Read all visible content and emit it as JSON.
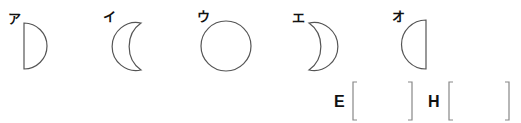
{
  "figures": [
    {
      "label": "ア",
      "shape": "half-moon-right-lit"
    },
    {
      "label": "イ",
      "shape": "crescent-left-lit"
    },
    {
      "label": "ウ",
      "shape": "full-circle"
    },
    {
      "label": "エ",
      "shape": "crescent-right-lit"
    },
    {
      "label": "オ",
      "shape": "half-moon-left-lit"
    }
  ],
  "answers": [
    {
      "label": "E",
      "value": ""
    },
    {
      "label": "H",
      "value": ""
    }
  ],
  "colors": {
    "stroke": "#555555",
    "text": "#111111"
  }
}
